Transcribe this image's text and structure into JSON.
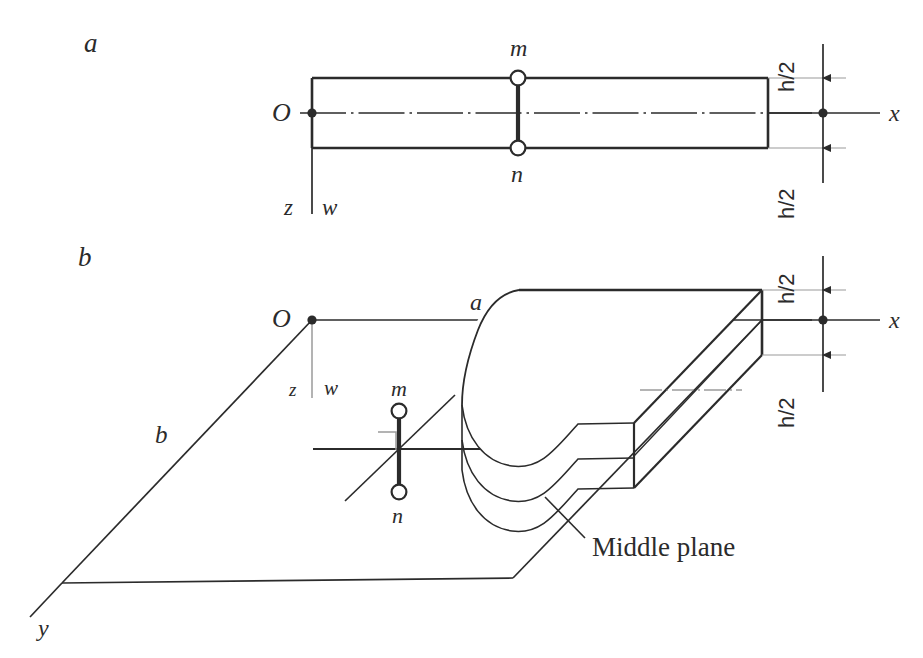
{
  "figure": {
    "type": "engineering-diagram",
    "background_color": "#ffffff",
    "ink_color": "#2b2b2b"
  },
  "panels": [
    {
      "id": "a",
      "label": "a",
      "description": "Edge-on (side) view of a plate strip with x axis along the middle plane and z/w downward.",
      "label_x": 88,
      "label_y": 44
    },
    {
      "id": "b",
      "label": "b",
      "description": "Three-dimensional pictorial view of a plate with torn-away edge showing thickness h, middle plane, and x, y, z axes.",
      "label_x": 82,
      "label_y": 258
    }
  ],
  "panel_a": {
    "origin_label": "O",
    "axis_x_label": "x",
    "axis_z_label": "z",
    "deflection_label": "w",
    "point_top_label": "m",
    "point_bottom_label": "n",
    "dim_top_label": "h/2",
    "dim_bottom_label": "h/2"
  },
  "panel_b": {
    "origin_label": "O",
    "axis_x_label": "x",
    "axis_y_label": "y",
    "axis_z_label": "z",
    "deflection_label": "w",
    "side_a_label": "a",
    "side_b_label": "b",
    "point_top_label": "m",
    "point_bottom_label": "n",
    "dim_top_label": "h/2",
    "dim_bottom_label": "h/2",
    "middle_plane_label": "Middle plane"
  },
  "geometry_notes": {
    "plate_thickness_symbol": "h",
    "half_thickness_symbol": "h/2",
    "in_plane_dimension_symbols": [
      "a",
      "b"
    ],
    "normal_segment": "m-n",
    "centerline_style": "dash-dot"
  }
}
